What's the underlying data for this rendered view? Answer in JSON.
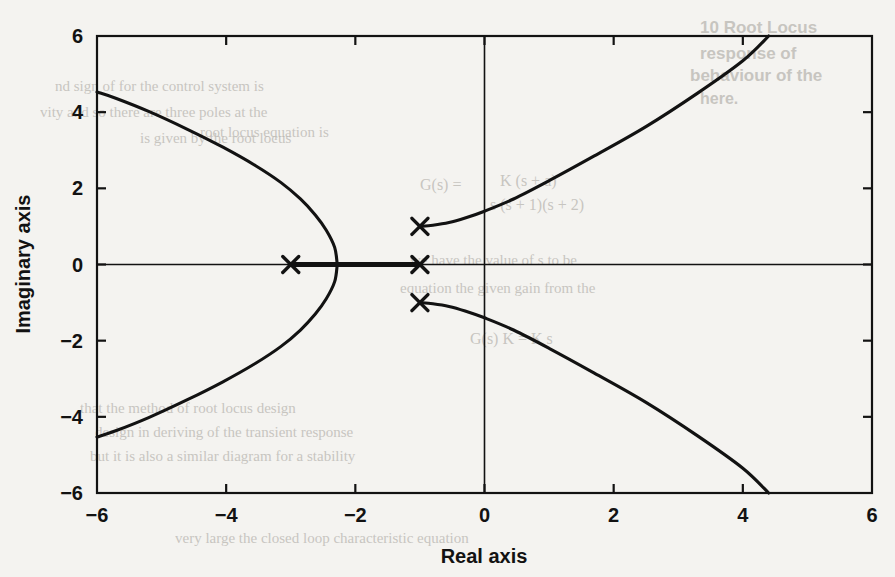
{
  "figure": {
    "background_color": "#f4f3f0",
    "ink_color": "#121212"
  },
  "axes": {
    "x_title": "Real axis",
    "y_title": "Imaginary axis",
    "x_ticks": [
      "−6",
      "−4",
      "−2",
      "0",
      "2",
      "4",
      "6"
    ],
    "y_ticks": [
      "6",
      "4",
      "2",
      "0",
      "−2",
      "−4",
      "−6"
    ]
  },
  "bleed_text": [
    {
      "text": "10  Root Locus",
      "x": 700,
      "y": 18,
      "size": 17,
      "serif": false
    },
    {
      "text": "response of",
      "x": 700,
      "y": 44,
      "size": 17,
      "serif": false
    },
    {
      "text": "behaviour of the",
      "x": 690,
      "y": 66,
      "size": 17,
      "serif": false
    },
    {
      "text": "here.",
      "x": 700,
      "y": 90,
      "size": 16,
      "serif": false
    },
    {
      "text": "nd sign of  for the   control  system  is",
      "x": 55,
      "y": 78,
      "size": 15,
      "serif": true
    },
    {
      "text": "vity  and  so there are  three  poles at the",
      "x": 40,
      "y": 104,
      "size": 15,
      "serif": true
    },
    {
      "text": "is  given  by the  root  locus",
      "x": 140,
      "y": 130,
      "size": 15,
      "serif": true
    },
    {
      "text": "root  locus  equation  is",
      "x": 200,
      "y": 124,
      "size": 15,
      "serif": true
    },
    {
      "text": "K (s + a)",
      "x": 500,
      "y": 172,
      "size": 16,
      "serif": true
    },
    {
      "text": "G(s) =",
      "x": 420,
      "y": 176,
      "size": 16,
      "serif": true
    },
    {
      "text": "s (s + 1)(s + 2)",
      "x": 490,
      "y": 196,
      "size": 16,
      "serif": true
    },
    {
      "text": "we have  the  value  of  s  to  be",
      "x": 410,
      "y": 252,
      "size": 15,
      "serif": true
    },
    {
      "text": "equation  the  given  gain  from  the",
      "x": 400,
      "y": 280,
      "size": 15,
      "serif": true
    },
    {
      "text": "G(s) K  =  K  s",
      "x": 470,
      "y": 330,
      "size": 16,
      "serif": true
    },
    {
      "text": "that  the  method  of  root  locus  design",
      "x": 80,
      "y": 400,
      "size": 15,
      "serif": true
    },
    {
      "text": "design   in  deriving  of  the  transient  response",
      "x": 95,
      "y": 424,
      "size": 15,
      "serif": true
    },
    {
      "text": "but   it  is  also  a  similar  diagram  for  a  stability",
      "x": 90,
      "y": 448,
      "size": 15,
      "serif": true
    },
    {
      "text": "very  large  the  closed  loop  characteristic  equation",
      "x": 175,
      "y": 530,
      "size": 15,
      "serif": true
    }
  ],
  "chart_data": {
    "type": "scatter",
    "title": "",
    "subtitle": "",
    "xlabel": "Real axis",
    "ylabel": "Imaginary axis",
    "xlim": [
      -6,
      6
    ],
    "ylim": [
      -6,
      6
    ],
    "xticks": [
      -6,
      -4,
      -2,
      0,
      2,
      4,
      6
    ],
    "yticks": [
      -6,
      -4,
      -2,
      0,
      2,
      4,
      6
    ],
    "grid": false,
    "legend": "none",
    "plot_kind": "root-locus",
    "markers": {
      "symbol": "x",
      "meaning": "open-loop pole",
      "points": [
        {
          "real": -3.0,
          "imag": 0.0
        },
        {
          "real": -1.0,
          "imag": 0.0
        },
        {
          "real": -1.0,
          "imag": 1.0
        },
        {
          "real": -1.0,
          "imag": -1.0
        }
      ]
    },
    "annotations": {
      "breakaway_point": {
        "real": -2.28,
        "imag": 0.0
      },
      "real_axis_segment": {
        "from": -3.0,
        "to": -1.0
      },
      "left_branch_edge_exits": [
        {
          "real": -6.0,
          "imag": 4.53
        },
        {
          "real": -6.0,
          "imag": -4.53
        }
      ],
      "right_branch_edge_exits": [
        {
          "real": 4.4,
          "imag": 6.0
        },
        {
          "real": 4.4,
          "imag": -6.0
        }
      ],
      "imaginary_axis_crossings": [
        {
          "real": 0.0,
          "imag": 1.53
        },
        {
          "real": 0.0,
          "imag": -1.53
        }
      ]
    },
    "series": [
      {
        "name": "upper-left branch",
        "comment": "departs breakaway upward, sweeps left to the -6 edge",
        "x": [
          -2.28,
          -2.32,
          -2.45,
          -2.62,
          -2.85,
          -3.15,
          -3.55,
          -4.05,
          -4.6,
          -5.2,
          -5.7,
          -6.0
        ],
        "y": [
          0.0,
          0.45,
          0.9,
          1.3,
          1.72,
          2.15,
          2.6,
          3.08,
          3.55,
          4.02,
          4.36,
          4.53
        ]
      },
      {
        "name": "lower-left branch",
        "comment": "mirror of upper-left branch about the real axis",
        "x": [
          -2.28,
          -2.32,
          -2.45,
          -2.62,
          -2.85,
          -3.15,
          -3.55,
          -4.05,
          -4.6,
          -5.2,
          -5.7,
          -6.0
        ],
        "y": [
          0.0,
          -0.45,
          -0.9,
          -1.3,
          -1.72,
          -2.15,
          -2.6,
          -3.08,
          -3.55,
          -4.02,
          -4.36,
          -4.53
        ]
      },
      {
        "name": "upper-right branch",
        "comment": "departs complex pole -1+j1 and rises to the top edge",
        "x": [
          -1.0,
          -0.8,
          -0.55,
          -0.3,
          0.0,
          0.45,
          1.0,
          1.7,
          2.5,
          3.3,
          4.0,
          4.4
        ],
        "y": [
          1.0,
          1.03,
          1.1,
          1.22,
          1.4,
          1.72,
          2.2,
          2.85,
          3.62,
          4.5,
          5.35,
          6.0
        ]
      },
      {
        "name": "lower-right branch",
        "comment": "mirror of upper-right branch about the real axis",
        "x": [
          -1.0,
          -0.8,
          -0.55,
          -0.3,
          0.0,
          0.45,
          1.0,
          1.7,
          2.5,
          3.3,
          4.0,
          4.4
        ],
        "y": [
          -1.0,
          -1.03,
          -1.1,
          -1.22,
          -1.4,
          -1.72,
          -2.2,
          -2.85,
          -3.62,
          -4.5,
          -5.35,
          -6.0
        ]
      },
      {
        "name": "real-axis segment",
        "comment": "thick locus on the real axis between the poles at -3 and -1",
        "x": [
          -3.0,
          -1.0
        ],
        "y": [
          0.0,
          0.0
        ]
      }
    ]
  }
}
